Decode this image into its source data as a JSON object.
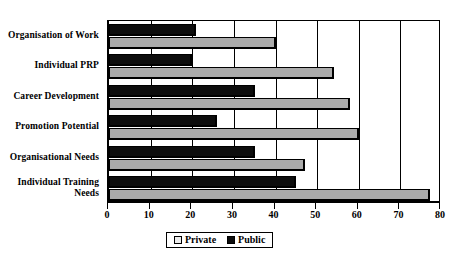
{
  "chart_data": {
    "type": "bar",
    "orientation": "horizontal",
    "title": "",
    "subtitle": "",
    "xlabel": "",
    "ylabel": "",
    "xlim": [
      0,
      80
    ],
    "xticks": [
      0,
      10,
      20,
      30,
      40,
      50,
      60,
      70,
      80
    ],
    "grid": true,
    "grid_axis": "x",
    "legend_position": "bottom-center",
    "categories": [
      "Organisation of Work",
      "Individual PRP",
      "Career Development",
      "Promotion Potential",
      "Organisational Needs",
      "Individual Training\nNeeds"
    ],
    "series": [
      {
        "name": "Private",
        "color": "#ababab",
        "values": [
          40,
          54,
          58,
          60,
          47,
          77
        ]
      },
      {
        "name": "Public",
        "color": "#0d0d0d",
        "values": [
          21,
          20,
          35,
          26,
          35,
          45
        ]
      }
    ]
  },
  "legend": {
    "items": [
      {
        "label": "Private",
        "swatch": "private-swatch"
      },
      {
        "label": "Public",
        "swatch": "public-swatch"
      }
    ]
  }
}
